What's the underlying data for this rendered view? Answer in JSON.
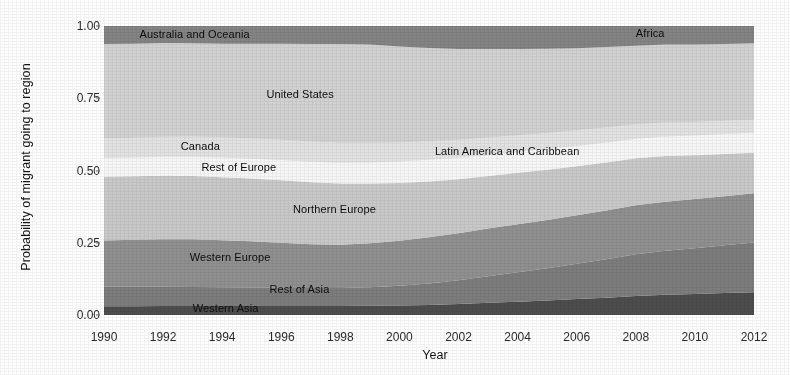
{
  "chart_data": {
    "type": "area",
    "stacked": true,
    "title": "",
    "subtitle": "",
    "xlabel": "Year",
    "ylabel": "Probability of migrant going to region",
    "xlim": [
      1990,
      2012
    ],
    "ylim": [
      0.0,
      1.0
    ],
    "grid": false,
    "legend_position": "in-plot-labels",
    "x": [
      1990,
      1991,
      1992,
      1993,
      1994,
      1995,
      1996,
      1997,
      1998,
      1999,
      2000,
      2001,
      2002,
      2003,
      2004,
      2005,
      2006,
      2007,
      2008,
      2009,
      2010,
      2011,
      2012
    ],
    "xticks": [
      1990,
      1992,
      1994,
      1996,
      1998,
      2000,
      2002,
      2004,
      2006,
      2008,
      2010,
      2012
    ],
    "xticklabels": [
      "1990",
      "1992",
      "1994",
      "1996",
      "1998",
      "2000",
      "2002",
      "2004",
      "2006",
      "2008",
      "2010",
      "2012"
    ],
    "yticks": [
      0.0,
      0.25,
      0.5,
      0.75,
      1.0
    ],
    "yticklabels": [
      "0.00",
      "0.25",
      "0.50",
      "0.75",
      "1.00"
    ],
    "series": [
      {
        "name": "Western Asia",
        "color": "#4d4d4d",
        "label_x": 1992.6,
        "label_y": 0.018,
        "values": [
          0.03,
          0.03,
          0.031,
          0.031,
          0.031,
          0.031,
          0.031,
          0.031,
          0.031,
          0.032,
          0.033,
          0.035,
          0.038,
          0.042,
          0.046,
          0.05,
          0.055,
          0.06,
          0.066,
          0.07,
          0.073,
          0.076,
          0.079
        ]
      },
      {
        "name": "Rest of Asia",
        "color": "#7d7d7d",
        "label_x": 1995.6,
        "label_y": 0.088,
        "values": [
          0.068,
          0.068,
          0.067,
          0.066,
          0.065,
          0.064,
          0.063,
          0.062,
          0.062,
          0.064,
          0.068,
          0.074,
          0.082,
          0.092,
          0.102,
          0.112,
          0.122,
          0.133,
          0.144,
          0.152,
          0.158,
          0.165,
          0.172
        ]
      },
      {
        "name": "Western Europe",
        "color": "#909090",
        "label_x": 1993.0,
        "label_y": 0.195,
        "values": [
          0.16,
          0.162,
          0.164,
          0.165,
          0.163,
          0.16,
          0.156,
          0.152,
          0.15,
          0.152,
          0.156,
          0.16,
          0.163,
          0.165,
          0.166,
          0.167,
          0.168,
          0.169,
          0.17,
          0.17,
          0.17,
          0.17,
          0.17
        ]
      },
      {
        "name": "Northern Europe",
        "color": "#c9c9c9",
        "label_x": 1996.4,
        "label_y": 0.362,
        "values": [
          0.22,
          0.22,
          0.22,
          0.219,
          0.218,
          0.217,
          0.216,
          0.214,
          0.212,
          0.207,
          0.2,
          0.193,
          0.187,
          0.182,
          0.178,
          0.174,
          0.17,
          0.166,
          0.162,
          0.158,
          0.152,
          0.146,
          0.14
        ]
      },
      {
        "name": "Rest of Europe",
        "color": "#f7f7f7",
        "label_x": 1993.2,
        "label_y": 0.515,
        "values": [
          0.065,
          0.065,
          0.066,
          0.067,
          0.068,
          0.069,
          0.07,
          0.071,
          0.072,
          0.073,
          0.074,
          0.075,
          0.074,
          0.073,
          0.072,
          0.071,
          0.07,
          0.069,
          0.068,
          0.068,
          0.068,
          0.069,
          0.07
        ]
      },
      {
        "name": "Canada",
        "color": "#e3e3e3",
        "label_x": 1992.6,
        "label_y": 0.58,
        "values": [
          0.068,
          0.068,
          0.069,
          0.07,
          0.07,
          0.07,
          0.07,
          0.07,
          0.069,
          0.068,
          0.066,
          0.064,
          0.062,
          0.06,
          0.058,
          0.056,
          0.054,
          0.052,
          0.05,
          0.048,
          0.047,
          0.046,
          0.045
        ]
      },
      {
        "name": "Latin America and Caribbean",
        "color": "#f2f2f2",
        "label_x": 2001.0,
        "label_y": 0.578,
        "values": [
          0.0,
          0.0,
          0.0,
          0.0,
          0.0,
          0.0,
          0.0,
          0.0,
          0.0,
          0.0,
          0.0,
          0.0,
          0.0,
          0.0,
          0.0,
          0.0,
          0.0,
          0.0,
          0.0,
          0.0,
          0.0,
          0.0,
          0.0
        ]
      },
      {
        "name": "United States",
        "color": "#d2d2d2",
        "label_x": 1995.5,
        "label_y": 0.76,
        "values": [
          0.327,
          0.326,
          0.324,
          0.322,
          0.324,
          0.328,
          0.333,
          0.338,
          0.342,
          0.34,
          0.332,
          0.323,
          0.314,
          0.306,
          0.298,
          0.291,
          0.284,
          0.278,
          0.272,
          0.27,
          0.268,
          0.266,
          0.264
        ]
      },
      {
        "name": "Australia and Oceania",
        "color": "#848484",
        "label_x": 1991.2,
        "label_y": 0.97,
        "values": [
          0.062,
          0.061,
          0.059,
          0.06,
          0.061,
          0.061,
          0.061,
          0.062,
          0.062,
          0.065,
          0.071,
          0.076,
          0.08,
          0.08,
          0.08,
          0.079,
          0.079,
          0.077,
          0.068,
          0.064,
          0.064,
          0.062,
          0.06
        ]
      },
      {
        "name": "Africa",
        "color": "#7a7a7a",
        "label_x": 2008.0,
        "label_y": 0.972,
        "values": [
          0.0,
          0.0,
          0.0,
          0.0,
          0.0,
          0.0,
          0.0,
          0.0,
          0.0,
          0.0,
          0.0,
          0.0,
          0.0,
          0.0,
          0.0,
          0.0,
          0.0,
          0.0,
          0.0,
          0.0,
          0.0,
          0.0,
          0.0
        ]
      }
    ],
    "annotations": [
      {
        "text": "Australia and Oceania",
        "x": 1991.2,
        "y": 0.968
      },
      {
        "text": "Africa",
        "x": 2008.0,
        "y": 0.972
      },
      {
        "text": "United States",
        "x": 1995.5,
        "y": 0.762
      },
      {
        "text": "Canada",
        "x": 1992.6,
        "y": 0.58
      },
      {
        "text": "Latin America and Caribbean",
        "x": 2001.2,
        "y": 0.565
      },
      {
        "text": "Rest of Europe",
        "x": 1993.3,
        "y": 0.508
      },
      {
        "text": "Northern Europe",
        "x": 1996.4,
        "y": 0.362
      },
      {
        "text": "Western Europe",
        "x": 1992.9,
        "y": 0.198
      },
      {
        "text": "Rest of Asia",
        "x": 1995.6,
        "y": 0.088
      },
      {
        "text": "Western Asia",
        "x": 1993.0,
        "y": 0.022
      }
    ]
  },
  "axes": {
    "ylabel": "Probability of migrant going to region",
    "xlabel": "Year",
    "yticklabels": [
      "1.00",
      "0.75",
      "0.50",
      "0.25",
      "0.00"
    ],
    "xticklabels": [
      "1990",
      "1992",
      "1994",
      "1996",
      "1998",
      "2000",
      "2002",
      "2004",
      "2006",
      "2008",
      "2010",
      "2012"
    ]
  },
  "colors": {
    "plot_background": "#f0f0f0",
    "page_background": "#ffffff",
    "tick_text": "#2b2b2b",
    "label_text": "#141414"
  }
}
